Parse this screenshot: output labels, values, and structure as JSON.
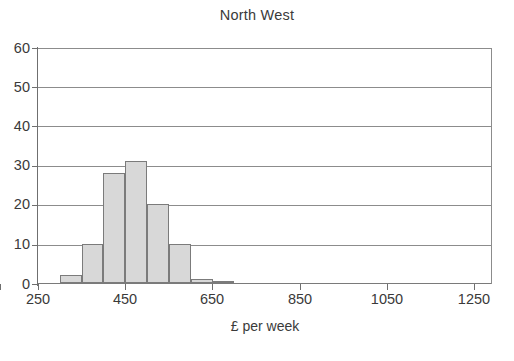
{
  "chart_data": {
    "type": "bar",
    "title": "North West",
    "xlabel": "£ per week",
    "ylabel": "",
    "xlim": [
      250,
      1290
    ],
    "ylim": [
      0,
      60
    ],
    "grid": true,
    "legend": false,
    "bin_width": 50,
    "x_ticks": [
      250,
      450,
      650,
      850,
      1050,
      1250
    ],
    "y_ticks": [
      0,
      10,
      20,
      30,
      40,
      50,
      60
    ],
    "x_tick_labels": [
      "250",
      "450",
      "650",
      "850",
      "1050",
      "1250"
    ],
    "y_tick_labels": [
      "0",
      "10",
      "20",
      "30",
      "40",
      "50",
      "60"
    ],
    "categories": [
      "250-300",
      "300-350",
      "350-400",
      "400-450",
      "450-500",
      "500-550",
      "550-600",
      "600-650",
      "650-700"
    ],
    "bins": [
      {
        "start": 250,
        "end": 300,
        "value": 0
      },
      {
        "start": 300,
        "end": 350,
        "value": 2
      },
      {
        "start": 350,
        "end": 400,
        "value": 10
      },
      {
        "start": 400,
        "end": 450,
        "value": 28
      },
      {
        "start": 450,
        "end": 500,
        "value": 31
      },
      {
        "start": 500,
        "end": 550,
        "value": 20
      },
      {
        "start": 550,
        "end": 600,
        "value": 10
      },
      {
        "start": 600,
        "end": 650,
        "value": 1
      },
      {
        "start": 650,
        "end": 700,
        "value": 0.4
      }
    ],
    "values": [
      0,
      2,
      10,
      28,
      31,
      20,
      10,
      1,
      0.4
    ],
    "colors": {
      "bar_fill": "#d8d8d8",
      "bar_edge": "#7b7b7b",
      "grid": "#8c8c8c",
      "axis": "#6f6f6f",
      "text": "#3a3a3a",
      "background": "#ffffff"
    }
  }
}
